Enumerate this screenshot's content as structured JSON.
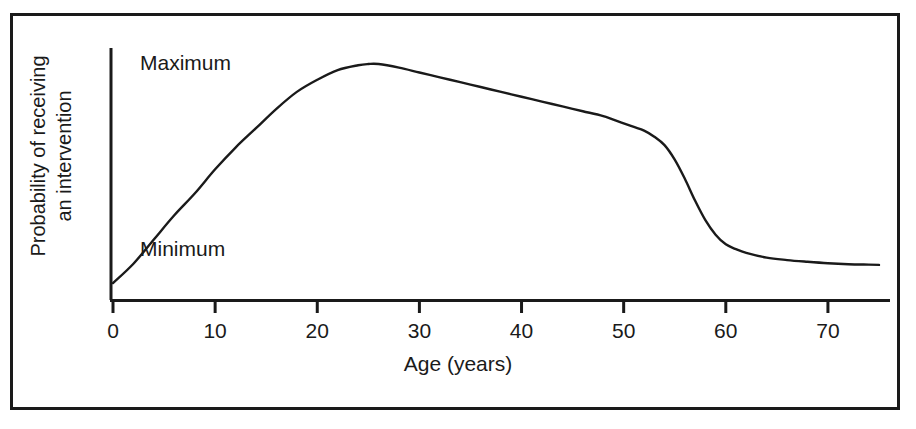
{
  "figure": {
    "background_color": "#ffffff",
    "frame_color": "#1a1a1a",
    "ink_color": "#1a1a1a"
  },
  "chart_data": {
    "type": "line",
    "title": "",
    "subtitle": "",
    "xlabel": "Age (years)",
    "ylabel": "Probability of receiving an intervention",
    "ylabel_line1": "Probability of receiving",
    "ylabel_line2": "an intervention",
    "xlim": [
      0,
      75
    ],
    "ylim": [
      0,
      1
    ],
    "xticks": [
      0,
      10,
      20,
      30,
      40,
      50,
      60,
      70
    ],
    "xticklabels": [
      "0",
      "10",
      "20",
      "30",
      "40",
      "50",
      "60",
      "70"
    ],
    "yticks": [],
    "yticklabels": [],
    "grid": false,
    "legend": null,
    "annotations": [
      {
        "text": "Maximum",
        "x": 4,
        "y": 0.97,
        "name": "maximum-level-label"
      },
      {
        "text": "Minimum",
        "x": 4,
        "y": 0.21,
        "name": "minimum-level-label"
      }
    ],
    "series": [
      {
        "name": "Probability of receiving an intervention",
        "color": "#1a1a1a",
        "line_width": 2,
        "x": [
          0,
          2,
          4,
          6,
          8,
          10,
          12,
          14,
          16,
          18,
          20,
          22,
          24,
          25,
          26,
          28,
          30,
          32,
          34,
          36,
          38,
          40,
          42,
          44,
          46,
          48,
          50,
          51,
          52,
          53,
          54,
          55,
          56,
          57,
          58,
          59,
          60,
          61,
          62,
          64,
          66,
          68,
          70,
          72,
          74,
          75
        ],
        "y": [
          0.07,
          0.15,
          0.25,
          0.35,
          0.44,
          0.54,
          0.63,
          0.71,
          0.79,
          0.86,
          0.91,
          0.95,
          0.97,
          0.975,
          0.975,
          0.96,
          0.94,
          0.92,
          0.9,
          0.88,
          0.86,
          0.84,
          0.82,
          0.8,
          0.78,
          0.76,
          0.73,
          0.715,
          0.7,
          0.675,
          0.64,
          0.58,
          0.5,
          0.41,
          0.33,
          0.27,
          0.23,
          0.21,
          0.195,
          0.175,
          0.165,
          0.158,
          0.152,
          0.148,
          0.146,
          0.145
        ]
      }
    ]
  }
}
